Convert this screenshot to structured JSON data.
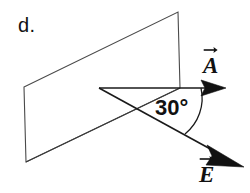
{
  "figure": {
    "panel_label": "d.",
    "angle_label": "30°",
    "background_color": "#ffffff",
    "stroke_color": "#1a1a1a",
    "text_color": "#111111"
  },
  "vectors": [
    {
      "id": "vector-a",
      "label": "A",
      "accent_name": "right-arrow-accent",
      "direction": "horizontal-right",
      "origin": [
        180,
        88
      ],
      "tip": [
        226,
        88
      ]
    },
    {
      "id": "vector-e",
      "label": "E",
      "accent_name": "right-arrow-accent",
      "direction": "down-right",
      "origin": [
        99,
        88
      ],
      "tip": [
        243,
        167
      ]
    }
  ],
  "shapes": {
    "plane_name": "parallelogram-plane",
    "plane_points": "24,87 178,12 180,88 26,162",
    "vertical_edge": "178,12 180,88",
    "baseline_name": "horizontal-baseline",
    "baseline": "99,88 205,88",
    "e_ray": "99,88 212,150",
    "crossing_ray": "26,162 180,88",
    "arc_name": "angle-arc-30",
    "arc_path": "M 201 88 A 44 44 0 0 1 185 133"
  }
}
